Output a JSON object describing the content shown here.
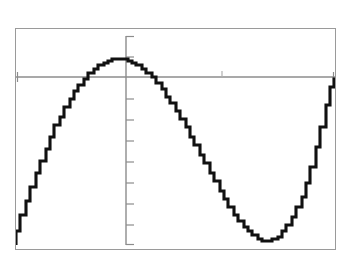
{
  "app": {
    "title": "Graphing Calculator Screen",
    "device": "graphing-calculator",
    "background_color": "#ffffff",
    "frame_color": "#9a9a9a",
    "axis_color": "#8c8c8c",
    "curve_color": "#111111"
  },
  "chart_data": {
    "type": "line",
    "title": "",
    "subtitle": "",
    "xlabel": "",
    "ylabel": "",
    "grid": false,
    "legend": null,
    "legend_position": "none",
    "annotations": [],
    "axes": {
      "x_axis_visible": true,
      "y_axis_visible": true,
      "x_axis_screen_y": 48,
      "y_axis_screen_x": 110,
      "xlim": [
        -3.45,
        6.45
      ],
      "ylim": [
        -7.3,
        1.6
      ],
      "x_tick_spacing": 1,
      "y_tick_spacing": 1,
      "x_tick_marks": [
        3
      ],
      "y_tick_marks": [
        1,
        -1,
        -2,
        -3,
        -4,
        -5,
        -6,
        -7
      ],
      "x_tick_labels": [],
      "y_tick_labels": []
    },
    "series": [
      {
        "name": "y",
        "color": "#111111",
        "points": [
          [
            -3.45,
            -7.15
          ],
          [
            -3.3,
            -6.55
          ],
          [
            -3.15,
            -5.95
          ],
          [
            -3.0,
            -5.35
          ],
          [
            -2.85,
            -4.8
          ],
          [
            -2.7,
            -4.25
          ],
          [
            -2.55,
            -3.72
          ],
          [
            -2.4,
            -3.22
          ],
          [
            -2.25,
            -2.76
          ],
          [
            -2.1,
            -2.32
          ],
          [
            -1.95,
            -1.92
          ],
          [
            -1.8,
            -1.55
          ],
          [
            -1.65,
            -1.21
          ],
          [
            -1.5,
            -0.9
          ],
          [
            -1.35,
            -0.63
          ],
          [
            -1.2,
            -0.39
          ],
          [
            -1.05,
            -0.18
          ],
          [
            -0.9,
            -0.01
          ],
          [
            -0.75,
            0.13
          ],
          [
            -0.6,
            0.25
          ],
          [
            -0.45,
            0.33
          ],
          [
            -0.3,
            0.38
          ],
          [
            -0.15,
            0.4
          ],
          [
            0.0,
            0.38
          ],
          [
            0.15,
            0.33
          ],
          [
            0.3,
            0.25
          ],
          [
            0.45,
            0.14
          ],
          [
            0.6,
            0.0
          ],
          [
            0.75,
            -0.17
          ],
          [
            0.9,
            -0.37
          ],
          [
            1.05,
            -0.59
          ],
          [
            1.2,
            -0.84
          ],
          [
            1.35,
            -1.12
          ],
          [
            1.5,
            -1.41
          ],
          [
            1.65,
            -1.72
          ],
          [
            1.8,
            -2.05
          ],
          [
            1.95,
            -2.39
          ],
          [
            2.1,
            -2.75
          ],
          [
            2.25,
            -3.11
          ],
          [
            2.4,
            -3.48
          ],
          [
            2.55,
            -3.85
          ],
          [
            2.7,
            -4.22
          ],
          [
            2.85,
            -4.58
          ],
          [
            3.0,
            -4.94
          ],
          [
            3.15,
            -5.28
          ],
          [
            3.3,
            -5.6
          ],
          [
            3.45,
            -5.9
          ],
          [
            3.6,
            -6.17
          ],
          [
            3.75,
            -6.41
          ],
          [
            3.9,
            -6.61
          ],
          [
            4.05,
            -6.77
          ],
          [
            4.2,
            -6.88
          ],
          [
            4.35,
            -6.94
          ],
          [
            4.5,
            -6.95
          ],
          [
            4.65,
            -6.9
          ],
          [
            4.8,
            -6.79
          ],
          [
            4.95,
            -6.61
          ],
          [
            5.1,
            -6.36
          ],
          [
            5.25,
            -6.04
          ],
          [
            5.4,
            -5.64
          ],
          [
            5.55,
            -5.16
          ],
          [
            5.7,
            -4.6
          ],
          [
            5.85,
            -3.95
          ],
          [
            6.0,
            -3.21
          ],
          [
            6.15,
            -2.38
          ],
          [
            6.3,
            -1.45
          ],
          [
            6.4,
            -0.78
          ],
          [
            6.45,
            -0.42
          ]
        ]
      }
    ],
    "features": {
      "local_maximum": {
        "x": -0.15,
        "y": 0.4
      },
      "local_minimum": {
        "x": 4.5,
        "y": -6.95
      },
      "x_intercepts": [
        -0.92,
        0.62,
        6.48
      ]
    }
  }
}
